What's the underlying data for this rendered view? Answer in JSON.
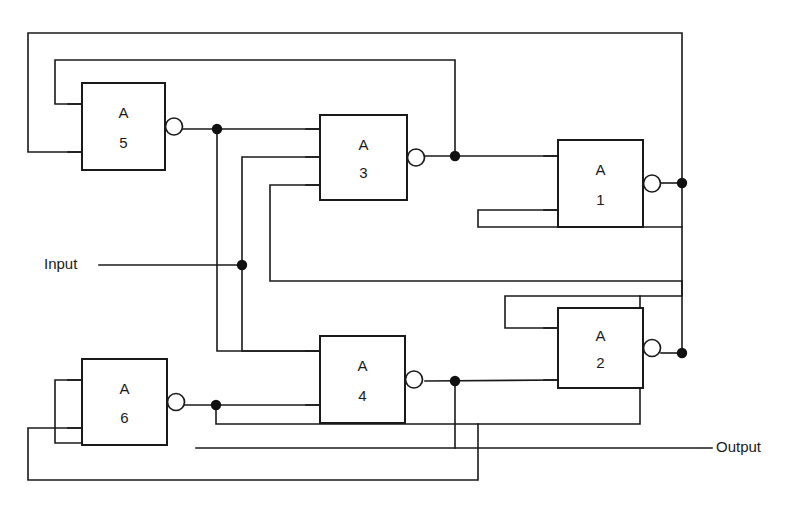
{
  "diagram": {
    "background_color": "#ffffff",
    "line_color": "#1a1a1a",
    "io": {
      "input_label": "Input",
      "output_label": "Output"
    },
    "gates": [
      {
        "id": "A5",
        "prefix": "A",
        "number": "5",
        "x": 82,
        "y": 83,
        "w": 83,
        "h": 87,
        "inputs": 2,
        "inverting": true
      },
      {
        "id": "A3",
        "prefix": "A",
        "number": "3",
        "x": 320,
        "y": 115,
        "w": 87,
        "h": 85,
        "inputs": 3,
        "inverting": true
      },
      {
        "id": "A1",
        "prefix": "A",
        "number": "1",
        "x": 558,
        "y": 140,
        "w": 85,
        "h": 87,
        "inputs": 2,
        "inverting": true
      },
      {
        "id": "A2",
        "prefix": "A",
        "number": "2",
        "x": 558,
        "y": 308,
        "w": 85,
        "h": 80,
        "inputs": 2,
        "inverting": true
      },
      {
        "id": "A4",
        "prefix": "A",
        "number": "4",
        "x": 320,
        "y": 336,
        "w": 85,
        "h": 87,
        "inputs": 2,
        "inverting": true
      },
      {
        "id": "A6",
        "prefix": "A",
        "number": "6",
        "x": 82,
        "y": 359,
        "w": 85,
        "h": 86,
        "inputs": 2,
        "inverting": true
      }
    ],
    "junctions": [
      {
        "name": "a5-output-node",
        "x": 217,
        "y": 129
      },
      {
        "name": "input-node",
        "x": 242,
        "y": 265
      },
      {
        "name": "a3-output-node",
        "x": 455,
        "y": 156
      },
      {
        "name": "a1-output-node",
        "x": 682,
        "y": 183
      },
      {
        "name": "a2-output-node",
        "x": 682,
        "y": 353
      },
      {
        "name": "a4-output-node",
        "x": 455,
        "y": 381
      },
      {
        "name": "a6-output-node",
        "x": 216,
        "y": 405
      }
    ],
    "nets": [
      {
        "name": "a5-out-to-a3-in1",
        "path": "M 183 129 L 455 129 L 455 156 L 558 156"
      },
      {
        "name": "a5-out-down-branch",
        "path": "M 217 129 L 217 351 L 320 351"
      },
      {
        "name": "a3-out-to-a1-in1",
        "path": "M 425 156 L 558 156"
      },
      {
        "name": "a1-out-rail-top",
        "path": "M 682 183 L 682 33 L 28 33 L 28 152 L 82 152"
      },
      {
        "name": "a1-out-to-a2-in1",
        "path": "M 682 183 L 682 296 L 478 296 L 478 328 L 558 328"
      },
      {
        "name": "a2-out-rail",
        "path": "M 682 353 L 682 281 L 270 281 L 270 185 L 320 185"
      },
      {
        "name": "a4-out-to-a2-in2",
        "path": "M 425 381 L 455 381 L 455 380 L 558 380"
      },
      {
        "name": "a4-out-down",
        "path": "M 455 381 L 455 448"
      },
      {
        "name": "output-run",
        "path": "M 196 448 L 712 448"
      },
      {
        "name": "a6-out-to-a4-in2",
        "path": "M 185 405 L 320 405"
      },
      {
        "name": "a6-out-down-rail",
        "path": "M 216 405 L 216 424 L 640 424 L 640 296"
      },
      {
        "name": "a6-out-bottom-rail",
        "path": "M 167 405 L 167 443 L 55 443 L 55 380 L 82 380"
      },
      {
        "name": "input-run",
        "path": "M 99 265 L 242 265"
      },
      {
        "name": "input-to-a3-in2",
        "path": "M 242 265 L 242 157 L 320 157"
      },
      {
        "name": "input-to-a4-in1",
        "path": "M 242 265 L 242 351 L 320 351"
      },
      {
        "name": "top-inner-rail",
        "path": "M 55 104 L 55 60 L 455 60 L 455 129"
      },
      {
        "name": "bottom-outer-rail",
        "path": "M 28 428 L 28 480 L 478 480 L 478 424"
      }
    ]
  }
}
